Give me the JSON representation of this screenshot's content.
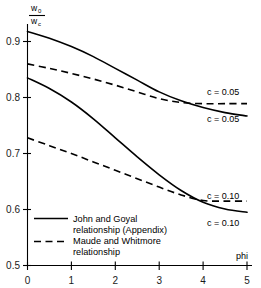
{
  "chart_data": {
    "type": "line",
    "title": "",
    "xlabel": "phi",
    "ylabel": "w0/wc",
    "ylabel_numerator": "w",
    "ylabel_numerator_sub": "0",
    "ylabel_denominator": "w",
    "ylabel_denominator_sub": "c",
    "xlim": [
      0,
      5
    ],
    "ylim": [
      0.5,
      0.95
    ],
    "grid": false,
    "legend_position": "inside-bottom-left",
    "xticks": [
      "0",
      "1",
      "2",
      "3",
      "4",
      "5"
    ],
    "xtick_values": [
      0,
      1,
      2,
      3,
      4,
      5
    ],
    "yticks": [
      "0.5",
      "0.6",
      "0.7",
      "0.8",
      "0.9"
    ],
    "ytick_values": [
      0.5,
      0.6,
      0.7,
      0.8,
      0.9
    ],
    "series": [
      {
        "name": "John and Goyal relationship (Appendix), c=0.05",
        "style": "solid",
        "label": "c = 0.05",
        "x": [
          0,
          0.5,
          1,
          1.5,
          2,
          2.5,
          3,
          3.5,
          4,
          4.5,
          5
        ],
        "values": [
          0.918,
          0.906,
          0.891,
          0.873,
          0.852,
          0.831,
          0.81,
          0.794,
          0.782,
          0.773,
          0.767
        ]
      },
      {
        "name": "Maude and Whitmore relationship, c=0.05",
        "style": "dashed",
        "label": "c = 0.05",
        "x": [
          0,
          0.5,
          1,
          1.5,
          2,
          2.5,
          3,
          3.5,
          4,
          4.5,
          5
        ],
        "values": [
          0.86,
          0.852,
          0.843,
          0.833,
          0.822,
          0.81,
          0.798,
          0.791,
          0.789,
          0.789,
          0.789
        ]
      },
      {
        "name": "John and Goyal relationship (Appendix), c=0.10",
        "style": "solid",
        "label": "c = 0.10",
        "x": [
          0,
          0.5,
          1,
          1.5,
          2,
          2.5,
          3,
          3.5,
          4,
          4.5,
          5
        ],
        "values": [
          0.835,
          0.816,
          0.792,
          0.762,
          0.728,
          0.694,
          0.662,
          0.634,
          0.613,
          0.601,
          0.595
        ]
      },
      {
        "name": "Maude and Whitmore relationship, c=0.10",
        "style": "dashed",
        "label": "c = 0.10",
        "x": [
          0,
          0.5,
          1,
          1.5,
          2,
          2.5,
          3,
          3.5,
          4,
          4.5,
          5
        ],
        "values": [
          0.728,
          0.714,
          0.7,
          0.685,
          0.67,
          0.655,
          0.64,
          0.626,
          0.616,
          0.615,
          0.615
        ]
      }
    ],
    "annotations": [
      {
        "text": "c = 0.05",
        "x": 4.55,
        "y": 0.806,
        "name": "annotation-dashed-c005"
      },
      {
        "text": "c = 0.05",
        "x": 4.55,
        "y": 0.757,
        "name": "annotation-solid-c005"
      },
      {
        "text": "c = 0.10",
        "x": 4.55,
        "y": 0.632,
        "name": "annotation-dashed-c010"
      },
      {
        "text": "c = 0.10",
        "x": 4.55,
        "y": 0.584,
        "name": "annotation-solid-c010"
      }
    ],
    "legend": [
      {
        "style": "solid",
        "line1": "John and Goyal",
        "line2": "relationship (Appendix)"
      },
      {
        "style": "dashed",
        "line1": "Maude and Whitmore",
        "line2": "relationship"
      }
    ]
  }
}
